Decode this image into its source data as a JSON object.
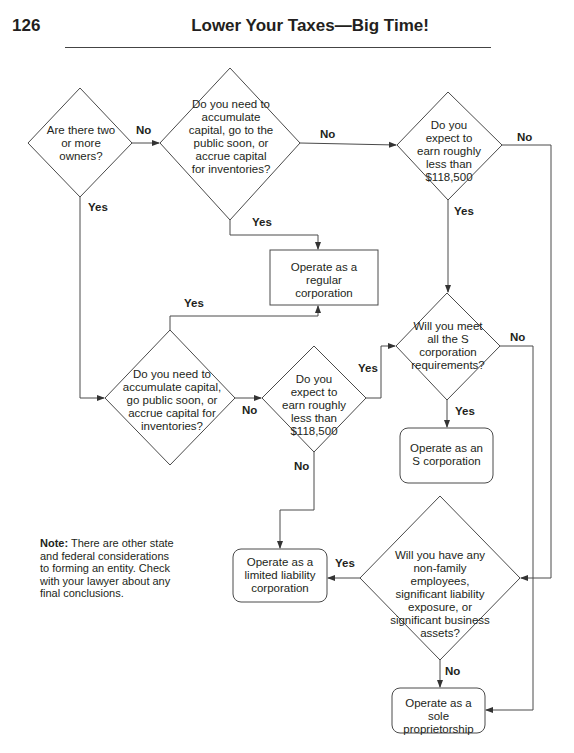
{
  "header": {
    "page_number": "126",
    "running_title": "Lower Your Taxes—Big Time!"
  },
  "decisions": {
    "owners": "Are there two or more owners?",
    "capital_top": "Do you need to accumulate capital, go to the public soon, or accrue capital for inventories?",
    "earn_top": "Do you expect to earn roughly less than $118,500",
    "capital_bottom": "Do you need to accumulate capital, go public soon, or accrue capital for inventories?",
    "earn_bottom": "Do you expect to earn roughly less than $118,500",
    "s_requirements": "Will you meet all the S corporation requirements?",
    "employees": "Will you have any non-family employees, significant liability exposure, or significant business assets?"
  },
  "outcomes": {
    "regular_corp": "Operate as a regular corporation",
    "s_corp": "Operate as an S corporation",
    "llc": "Operate as a limited liability corporation",
    "sole_prop": "Operate as a sole proprietorship"
  },
  "edge_labels": {
    "yes": "Yes",
    "no": "No"
  },
  "note": {
    "label": "Note:",
    "text": " There are other state and federal considerations to forming an entity. Check with your lawyer about any final conclusions."
  },
  "colors": {
    "line": "#4a4a4a",
    "text": "#231f20",
    "background": "#ffffff"
  }
}
